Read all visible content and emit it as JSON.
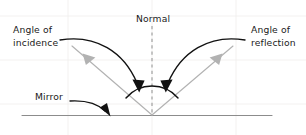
{
  "diagram": {
    "type": "physics-ray-diagram",
    "background_color": "#ffffff",
    "labels": {
      "angle_of_incidence_line1": "Angle of",
      "angle_of_incidence_line2": "incidence",
      "angle_of_reflection_line1": "Angle of",
      "angle_of_reflection_line2": "reflection",
      "normal": "Normal",
      "mirror": "Mirror"
    },
    "colors": {
      "ray": "#b2b2b2",
      "mirror": "#8c8c8c",
      "normal": "#9a9a9a",
      "arc": "#111111",
      "pointer": "#111111",
      "text": "#1a1a1a",
      "grid": "#f0eeec"
    },
    "elements": {
      "incident_ray": "light-gray arrow travelling down-right toward the mirror point",
      "reflected_ray": "light-gray arrow travelling up-right away from the mirror point",
      "normal": "vertical dashed line at the point of incidence",
      "mirror": "horizontal gray line representing the mirror surface",
      "angle_arc": "black arc spanning from the incident ray to the reflected ray across the normal"
    }
  }
}
